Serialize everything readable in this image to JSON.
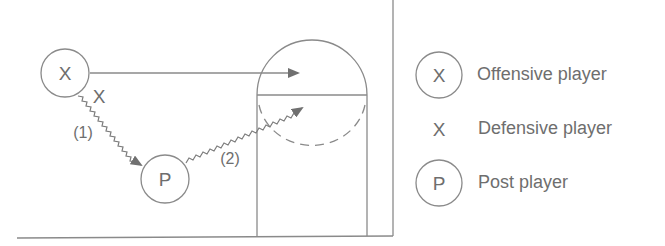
{
  "diagram": {
    "court": {
      "baseline": "bottom line",
      "sideline": "right boundary",
      "lane": "free-throw lane with circle (solid top half, dashed bottom half)"
    },
    "players": {
      "offensive": {
        "symbol": "X",
        "circled": true
      },
      "defensive": {
        "symbol": "X",
        "circled": false
      },
      "post": {
        "symbol": "P",
        "circled": true
      }
    },
    "paths": [
      {
        "id": "1",
        "label": "(1)",
        "type": "dribble",
        "from": "offensive",
        "to": "post"
      },
      {
        "id": "2",
        "label": "(2)",
        "type": "dribble",
        "from": "post",
        "to": "free-throw circle"
      },
      {
        "id": "cut",
        "label": "",
        "type": "cut",
        "from": "offensive",
        "to": "free-throw circle"
      }
    ]
  },
  "legend": {
    "items": [
      {
        "symbol": "X",
        "circled": true,
        "label": "Offensive player"
      },
      {
        "symbol": "X",
        "circled": false,
        "label": "Defensive player"
      },
      {
        "symbol": "P",
        "circled": true,
        "label": "Post player"
      }
    ]
  },
  "colors": {
    "line": "#8a8a8a",
    "arrow": "#707070",
    "text": "#6e6e6e"
  }
}
